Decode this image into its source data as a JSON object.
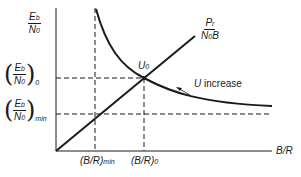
{
  "diagram": {
    "type": "conceptual-plot",
    "axes": {
      "y_label": {
        "numerator": "E",
        "numerator_sub": "b",
        "denominator": "N",
        "denominator_sub": "0"
      },
      "x_label": "B/R"
    },
    "curves": {
      "line_label": {
        "numerator": "P",
        "numerator_sub": "r",
        "denominator": "N",
        "denominator_sub": "0",
        "denominator_suffix": "B"
      },
      "hyperbola_note": "U increase",
      "operating_point": {
        "label": "U",
        "label_sub": "0"
      }
    },
    "y_ticks": [
      {
        "id": "eb_n0_0",
        "numerator": "E",
        "numerator_sub": "b",
        "denominator": "N",
        "denominator_sub": "0",
        "outer_sub": "0"
      },
      {
        "id": "eb_n0_min",
        "numerator": "E",
        "numerator_sub": "b",
        "denominator": "N",
        "denominator_sub": "0",
        "outer_sub": "min"
      }
    ],
    "x_ticks": [
      {
        "id": "br_min",
        "text": "(B/R)",
        "sub": "min"
      },
      {
        "id": "br_0",
        "text": "(B/R)",
        "sub": "0"
      }
    ],
    "colors": {
      "ink": "#1a1a1a",
      "background": "#ffffff"
    }
  }
}
